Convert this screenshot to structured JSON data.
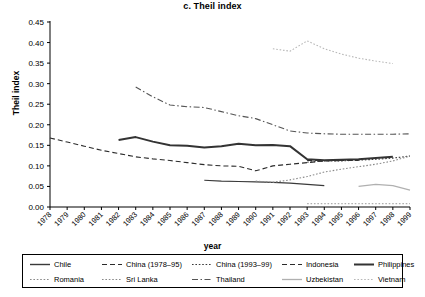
{
  "chart_data": {
    "type": "line",
    "title": "c. Theil index",
    "xlabel": "year",
    "ylabel": "Theil index",
    "ylim": [
      0.0,
      0.45
    ],
    "ytick_labels": [
      "0.00",
      "0.05",
      "0.10",
      "0.15",
      "0.20",
      "0.25",
      "0.30",
      "0.35",
      "0.40",
      "0.45"
    ],
    "ytick_values": [
      0.0,
      0.05,
      0.1,
      0.15,
      0.2,
      0.25,
      0.3,
      0.35,
      0.4,
      0.45
    ],
    "categories": [
      "1978",
      "1979",
      "1980",
      "1981",
      "1982",
      "1983",
      "1984",
      "1985",
      "1986",
      "1987",
      "1988",
      "1989",
      "1990",
      "1991",
      "1992",
      "1993",
      "1994",
      "1995",
      "1996",
      "1997",
      "1998",
      "1999"
    ],
    "grid": false,
    "legend_position": "bottom",
    "series": [
      {
        "name": "Chile",
        "style": "solid",
        "color": "#3a3a3a",
        "width": 1.1,
        "x": [
          "1987",
          "1988",
          "1989",
          "1990",
          "1991",
          "1992",
          "1993",
          "1994"
        ],
        "values": [
          0.065,
          0.063,
          0.062,
          0.061,
          0.06,
          0.058,
          0.055,
          0.052
        ]
      },
      {
        "name": "China (1978–95)",
        "style": "dashed",
        "color": "#2b2b2b",
        "width": 1.1,
        "x": [
          "1978",
          "1979",
          "1980",
          "1981",
          "1982",
          "1983",
          "1984",
          "1985",
          "1986",
          "1987",
          "1988",
          "1989",
          "1990",
          "1991",
          "1992",
          "1993",
          "1994",
          "1995"
        ],
        "values": [
          0.168,
          0.158,
          0.148,
          0.138,
          0.13,
          0.122,
          0.117,
          0.113,
          0.108,
          0.103,
          0.1,
          0.099,
          0.088,
          0.1,
          0.104,
          0.108,
          0.112,
          0.113
        ]
      },
      {
        "name": "China (1993–99)",
        "style": "dotted",
        "color": "#3a3a3a",
        "width": 1.1,
        "x": [
          "1993",
          "1994",
          "1995",
          "1996",
          "1997",
          "1998",
          "1999"
        ],
        "values": [
          0.109,
          0.112,
          0.112,
          0.114,
          0.116,
          0.119,
          0.124
        ]
      },
      {
        "name": "Indonesia",
        "style": "dashed",
        "color": "#2b2b2b",
        "width": 1.1,
        "x": [
          "1993",
          "1994",
          "1995",
          "1996"
        ],
        "values": [
          0.113,
          0.113,
          0.113,
          0.113
        ]
      },
      {
        "name": "Philippines",
        "style": "solid",
        "color": "#333333",
        "width": 2.0,
        "x": [
          "1982",
          "1983",
          "1984",
          "1985",
          "1986",
          "1987",
          "1988",
          "1989",
          "1990",
          "1991",
          "1992",
          "1993",
          "1994",
          "1995",
          "1996",
          "1997",
          "1998"
        ],
        "values": [
          0.163,
          0.17,
          0.159,
          0.15,
          0.149,
          0.145,
          0.148,
          0.154,
          0.15,
          0.151,
          0.148,
          0.116,
          0.114,
          0.115,
          0.116,
          0.119,
          0.122
        ]
      },
      {
        "name": "Romania",
        "style": "dotted",
        "color": "#9a9a9a",
        "width": 1.0,
        "x": [
          "1993",
          "1994",
          "1995",
          "1996",
          "1997",
          "1998",
          "1999"
        ],
        "values": [
          0.008,
          0.008,
          0.008,
          0.008,
          0.008,
          0.008,
          0.008
        ]
      },
      {
        "name": "Sri Lanka",
        "style": "dotted",
        "color": "#8a8a8a",
        "width": 1.1,
        "x": [
          "1990",
          "1991",
          "1992",
          "1993",
          "1994",
          "1995",
          "1996",
          "1997",
          "1998",
          "1999"
        ],
        "values": [
          0.063,
          0.06,
          0.066,
          0.074,
          0.085,
          0.092,
          0.098,
          0.104,
          0.112,
          0.124
        ]
      },
      {
        "name": "Thailand",
        "style": "dashdot",
        "color": "#555555",
        "width": 1.1,
        "x": [
          "1983",
          "1984",
          "1985",
          "1986",
          "1987",
          "1988",
          "1989",
          "1990",
          "1991",
          "1992",
          "1993",
          "1994",
          "1995",
          "1996",
          "1997",
          "1998",
          "1999"
        ],
        "values": [
          0.292,
          0.268,
          0.248,
          0.244,
          0.242,
          0.232,
          0.222,
          0.215,
          0.2,
          0.185,
          0.18,
          0.178,
          0.177,
          0.177,
          0.177,
          0.177,
          0.178
        ]
      },
      {
        "name": "Uzbekistan",
        "style": "solid",
        "color": "#b0b0b0",
        "width": 1.2,
        "x": [
          "1996",
          "1997",
          "1998",
          "1999"
        ],
        "values": [
          0.05,
          0.055,
          0.052,
          0.041
        ]
      },
      {
        "name": "Vietnam",
        "style": "dotted",
        "color": "#b8b8b8",
        "width": 1.1,
        "x": [
          "1991",
          "1992",
          "1993",
          "1994",
          "1995",
          "1996",
          "1997",
          "1998"
        ],
        "values": [
          0.385,
          0.379,
          0.404,
          0.385,
          0.372,
          0.362,
          0.355,
          0.349
        ]
      }
    ],
    "legend_entries": [
      {
        "label": "Chile",
        "style": "solid",
        "color": "#3a3a3a",
        "width": 1.4
      },
      {
        "label": "China (1978–95)",
        "style": "dashed",
        "color": "#2b2b2b",
        "width": 1.1
      },
      {
        "label": "China (1993–99)",
        "style": "dotted",
        "color": "#3a3a3a",
        "width": 1.2
      },
      {
        "label": "Indonesia",
        "style": "dashed",
        "color": "#2b2b2b",
        "width": 1.1
      },
      {
        "label": "Philippines",
        "style": "solid",
        "color": "#333333",
        "width": 2.0
      },
      {
        "label": "Romania",
        "style": "dotted",
        "color": "#8a8a8a",
        "width": 1.1
      },
      {
        "label": "Sri Lanka",
        "style": "dotted",
        "color": "#8a8a8a",
        "width": 1.2
      },
      {
        "label": "Thailand",
        "style": "dashdot",
        "color": "#555555",
        "width": 1.1
      },
      {
        "label": "Uzbekistan",
        "style": "solid",
        "color": "#b0b0b0",
        "width": 1.3
      },
      {
        "label": "Vietnam",
        "style": "dotted",
        "color": "#b8b8b8",
        "width": 1.2
      }
    ]
  }
}
